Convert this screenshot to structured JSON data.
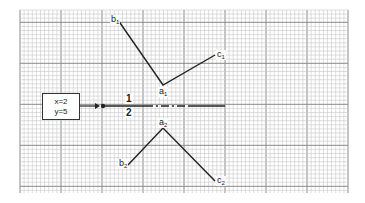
{
  "diagram": {
    "grid": {
      "x0": 20,
      "y0": 10,
      "x1": 348,
      "y1": 193,
      "minor_pitch": 4.1,
      "major_every": 10,
      "minor_color": "#c8c8c8",
      "major_color": "#8a8a8a"
    },
    "input_box": {
      "line1": "x=2",
      "line2": "y=5"
    },
    "branch_labels": {
      "top": "1",
      "bottom": "2"
    },
    "shape_1": {
      "points": {
        "b": [
          118,
          20
        ],
        "a": [
          163,
          85
        ],
        "c": [
          215,
          55
        ]
      },
      "labels": {
        "b": "b",
        "a": "a",
        "c": "c",
        "sub": "1"
      }
    },
    "shape_2": {
      "points": {
        "b": [
          128,
          165
        ],
        "a": [
          163,
          128
        ],
        "c": [
          215,
          181
        ]
      },
      "labels": {
        "b": "b",
        "a": "a",
        "c": "c",
        "sub": "2"
      }
    },
    "line_color": "#222222"
  }
}
